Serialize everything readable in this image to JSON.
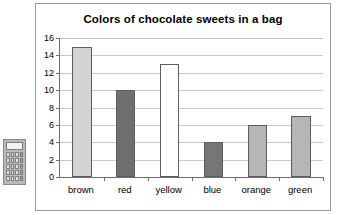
{
  "calculator": {
    "icon": "calculator-icon",
    "keys": [
      "key",
      "key",
      "key",
      "key",
      "key",
      "key",
      "key",
      "key",
      "key",
      "key",
      "key",
      "key",
      "key",
      "key",
      "key",
      "key",
      "key",
      "key",
      "key",
      "key"
    ]
  },
  "chart_data": {
    "type": "bar",
    "title": "Colors of chocolate sweets in a bag",
    "xlabel": "",
    "ylabel": "",
    "categories": [
      "brown",
      "red",
      "yellow",
      "blue",
      "orange",
      "green"
    ],
    "values": [
      15,
      10,
      13,
      4,
      6,
      7
    ],
    "bar_colors": [
      "#d4d4d4",
      "#6f6f6f",
      "#ffffff",
      "#767676",
      "#b6b6b6",
      "#b6b6b6"
    ],
    "bar_border_color": "#5d5d5d",
    "ylim": [
      0,
      16
    ],
    "ytick_step": 2,
    "yticks": [
      "0",
      "2",
      "4",
      "6",
      "8",
      "10",
      "12",
      "14",
      "16"
    ],
    "grid": true,
    "legend": "none"
  }
}
